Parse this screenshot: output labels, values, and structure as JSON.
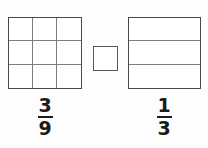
{
  "page": {
    "background_color": "#fdfdfd",
    "type": "fraction-comparison-worksheet"
  },
  "left_model": {
    "name": "three-by-three-grid",
    "rows": 3,
    "columns": 3,
    "total_parts": 9,
    "shaded_parts": 0,
    "border_color": "#4a4a4a",
    "grid_line_color": "#7d7d7d",
    "fill_color": "#ffffff",
    "cells": [
      {
        "row": 1,
        "col": 1,
        "shaded": false
      },
      {
        "row": 1,
        "col": 2,
        "shaded": false
      },
      {
        "row": 1,
        "col": 3,
        "shaded": false
      },
      {
        "row": 2,
        "col": 1,
        "shaded": false
      },
      {
        "row": 2,
        "col": 2,
        "shaded": false
      },
      {
        "row": 2,
        "col": 3,
        "shaded": false
      },
      {
        "row": 3,
        "col": 1,
        "shaded": false
      },
      {
        "row": 3,
        "col": 2,
        "shaded": false
      },
      {
        "row": 3,
        "col": 3,
        "shaded": false
      }
    ]
  },
  "left_fraction": {
    "numerator": "3",
    "denominator": "9",
    "text": "3/9",
    "color": "#1b1b1b"
  },
  "comparison_box": {
    "name": "answer-box",
    "value": "",
    "placeholder": "",
    "border_color": "#575757",
    "fill_color": "#ffffff"
  },
  "right_model": {
    "name": "three-row-square",
    "rows": 3,
    "columns": 1,
    "total_parts": 3,
    "shaded_parts": 0,
    "border_color": "#4a4a4a",
    "grid_line_color": "#7d7d7d",
    "fill_color": "#ffffff",
    "bands": [
      {
        "row": 1,
        "shaded": false
      },
      {
        "row": 2,
        "shaded": false
      },
      {
        "row": 3,
        "shaded": false
      }
    ]
  },
  "right_fraction": {
    "numerator": "1",
    "denominator": "3",
    "text": "1/3",
    "color": "#1b1b1b"
  }
}
